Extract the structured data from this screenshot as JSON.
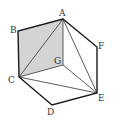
{
  "diagram": {
    "type": "geometry-hexagon-cube",
    "colors": {
      "edge": "#1a1a1a",
      "thin_line": "#333333",
      "shaded_face": "#d4d4d4",
      "label": "#333333",
      "background": "#ffffff"
    },
    "points": {
      "A": {
        "label": "A",
        "x": 63,
        "y": 19
      },
      "B": {
        "label": "B",
        "x": 18,
        "y": 31
      },
      "C": {
        "label": "C",
        "x": 19,
        "y": 77
      },
      "D": {
        "label": "D",
        "x": 52,
        "y": 105
      },
      "E": {
        "label": "E",
        "x": 97,
        "y": 93
      },
      "F": {
        "label": "F",
        "x": 97,
        "y": 47
      },
      "G": {
        "label": "G",
        "x": 63,
        "y": 65
      }
    },
    "shaded_region": [
      "A",
      "B",
      "C",
      "G"
    ],
    "outline_edges": [
      [
        "A",
        "B"
      ],
      [
        "B",
        "C"
      ],
      [
        "C",
        "D"
      ],
      [
        "D",
        "E"
      ],
      [
        "E",
        "F"
      ],
      [
        "F",
        "A"
      ]
    ],
    "inner_edges": [
      [
        "A",
        "G"
      ],
      [
        "G",
        "C"
      ],
      [
        "G",
        "E"
      ],
      [
        "A",
        "C"
      ],
      [
        "A",
        "E"
      ],
      [
        "C",
        "E"
      ]
    ]
  }
}
